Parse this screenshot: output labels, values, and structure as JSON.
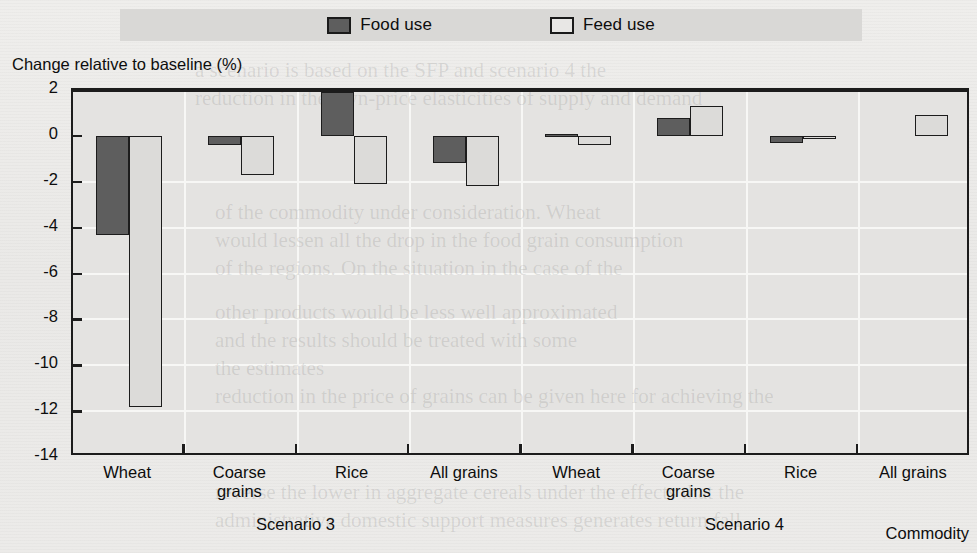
{
  "legend": {
    "entries": [
      {
        "label": "Food use",
        "key": "food",
        "color": "#5e5e5e"
      },
      {
        "label": "Feed use",
        "key": "feed",
        "color": "#e8e7e5"
      }
    ]
  },
  "axes": {
    "y_title": "Change relative to baseline (%)",
    "x_title": "Commodity",
    "y_ticks": [
      "2",
      "0",
      "-2",
      "-4",
      "-6",
      "-8",
      "-10",
      "-12",
      "-14"
    ]
  },
  "groups": [
    {
      "scenario": "Scenario 3",
      "categories": [
        "Wheat",
        "Coarse\ngrains",
        "Rice",
        "All grains"
      ]
    },
    {
      "scenario": "Scenario 4",
      "categories": [
        "Wheat",
        "Coarse\ngrains",
        "Rice",
        "All grains"
      ]
    }
  ],
  "chart_data": {
    "type": "bar",
    "title": "",
    "xlabel": "Commodity",
    "ylabel": "Change relative to baseline (%)",
    "ylim": [
      -14,
      2
    ],
    "ytick_values": [
      2,
      0,
      -2,
      -4,
      -6,
      -8,
      -10,
      -12,
      -14
    ],
    "grid": "horizontal-and-vertical",
    "legend_position": "top-center",
    "group_labels": [
      "Scenario 3",
      "Scenario 4"
    ],
    "categories": [
      "Scenario 3 / Wheat",
      "Scenario 3 / Coarse grains",
      "Scenario 3 / Rice",
      "Scenario 3 / All grains",
      "Scenario 4 / Wheat",
      "Scenario 4 / Coarse grains",
      "Scenario 4 / Rice",
      "Scenario 4 / All grains"
    ],
    "series": [
      {
        "name": "Food use",
        "color": "#5e5e5e",
        "values": [
          -4.3,
          -0.4,
          1.9,
          -1.2,
          0.1,
          0.8,
          -0.3,
          0.0
        ]
      },
      {
        "name": "Feed use",
        "color": "#dcdbd9",
        "values": [
          -11.8,
          -1.7,
          -2.1,
          -2.2,
          -0.4,
          1.3,
          -0.1,
          0.9
        ]
      }
    ]
  },
  "bleed_text": [
    {
      "t": "a scenario is based on the SFP and scenario 4 the",
      "x": 195,
      "y": 58
    },
    {
      "t": "reduction in the own-price elasticities of supply and demand",
      "x": 195,
      "y": 86
    },
    {
      "t": "of the commodity under consideration. Wheat",
      "x": 215,
      "y": 200
    },
    {
      "t": "would lessen all the drop in the food grain consumption",
      "x": 215,
      "y": 228
    },
    {
      "t": "of the regions. On the situation in the case of the",
      "x": 215,
      "y": 256
    },
    {
      "t": "other products would be less well approximated",
      "x": 215,
      "y": 300
    },
    {
      "t": "and the results should be treated with some",
      "x": 215,
      "y": 328
    },
    {
      "t": "the estimates",
      "x": 215,
      "y": 356
    },
    {
      "t": "reduction in the price of grains can be given here for achieving the",
      "x": 215,
      "y": 384
    },
    {
      "t": "reverse the lower in aggregate cereals under the effects that the",
      "x": 215,
      "y": 480
    },
    {
      "t": "administrative domestic support measures generates return fall",
      "x": 215,
      "y": 508
    }
  ]
}
